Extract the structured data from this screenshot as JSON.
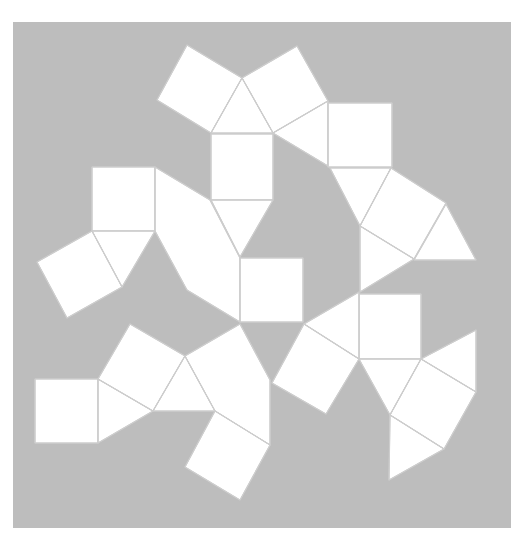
{
  "diagram": {
    "title": "",
    "colors": {
      "page": "#ffffff",
      "background": "#bdbdbd",
      "face_fill": "#ffffff",
      "edge_stroke": "#cdcdcd"
    },
    "background_rect": {
      "x": 13,
      "y": 22,
      "width": 498,
      "height": 506
    },
    "faces": [
      {
        "id": "sq-top-left",
        "type": "square",
        "points": [
          [
            187,
            45
          ],
          [
            242,
            78
          ],
          [
            211,
            133
          ],
          [
            157,
            100
          ]
        ]
      },
      {
        "id": "sq-top-right",
        "type": "square",
        "points": [
          [
            242,
            78
          ],
          [
            297,
            46
          ],
          [
            328,
            101
          ],
          [
            273,
            133
          ]
        ]
      },
      {
        "id": "tri-top-center",
        "type": "triangle",
        "points": [
          [
            242,
            78
          ],
          [
            273,
            133
          ],
          [
            211,
            133
          ]
        ]
      },
      {
        "id": "tri-top-right",
        "type": "triangle",
        "points": [
          [
            273,
            133
          ],
          [
            328,
            101
          ],
          [
            328,
            166
          ]
        ]
      },
      {
        "id": "sq-right-upper",
        "type": "square",
        "points": [
          [
            328,
            103
          ],
          [
            392,
            103
          ],
          [
            392,
            167
          ],
          [
            328,
            167
          ]
        ]
      },
      {
        "id": "sq-center-upper",
        "type": "square",
        "points": [
          [
            211,
            134
          ],
          [
            273,
            134
          ],
          [
            273,
            200
          ],
          [
            211,
            200
          ]
        ]
      },
      {
        "id": "tri-center-upper",
        "type": "triangle",
        "points": [
          [
            211,
            200
          ],
          [
            273,
            200
          ],
          [
            240,
            257
          ]
        ]
      },
      {
        "id": "tri-under-right-sq",
        "type": "triangle",
        "points": [
          [
            330,
            168
          ],
          [
            391,
            168
          ],
          [
            360,
            226
          ]
        ]
      },
      {
        "id": "sq-right-rotated",
        "type": "square",
        "points": [
          [
            391,
            168
          ],
          [
            446,
            203
          ],
          [
            414,
            259
          ],
          [
            360,
            226
          ]
        ]
      },
      {
        "id": "tri-far-right",
        "type": "triangle",
        "points": [
          [
            446,
            204
          ],
          [
            476,
            260
          ],
          [
            414,
            260
          ]
        ]
      },
      {
        "id": "tri-right-lower",
        "type": "triangle",
        "points": [
          [
            360,
            226
          ],
          [
            414,
            259
          ],
          [
            360,
            292
          ]
        ]
      },
      {
        "id": "sq-left-upper",
        "type": "square",
        "points": [
          [
            92,
            167
          ],
          [
            155,
            167
          ],
          [
            155,
            231
          ],
          [
            92,
            231
          ]
        ]
      },
      {
        "id": "tri-left-upper",
        "type": "triangle",
        "points": [
          [
            92,
            231
          ],
          [
            155,
            231
          ],
          [
            122,
            287
          ]
        ]
      },
      {
        "id": "sq-left-rotated",
        "type": "square",
        "points": [
          [
            92,
            231
          ],
          [
            122,
            287
          ],
          [
            67,
            318
          ],
          [
            37,
            262
          ]
        ]
      },
      {
        "id": "merged-center-left",
        "type": "polygon",
        "points": [
          [
            155,
            167
          ],
          [
            210,
            200
          ],
          [
            240,
            258
          ],
          [
            240,
            322
          ],
          [
            187,
            290
          ],
          [
            155,
            231
          ]
        ]
      },
      {
        "id": "sq-center-lower",
        "type": "square",
        "points": [
          [
            240,
            258
          ],
          [
            303,
            258
          ],
          [
            303,
            322
          ],
          [
            240,
            322
          ]
        ]
      },
      {
        "id": "sq-bottom-left",
        "type": "square",
        "points": [
          [
            35,
            379
          ],
          [
            98,
            379
          ],
          [
            98,
            443
          ],
          [
            35,
            443
          ]
        ]
      },
      {
        "id": "tri-bottom-left",
        "type": "triangle",
        "points": [
          [
            98,
            379
          ],
          [
            153,
            411
          ],
          [
            98,
            443
          ]
        ]
      },
      {
        "id": "sq-bottom-left-rotated",
        "type": "square",
        "points": [
          [
            98,
            379
          ],
          [
            130,
            324
          ],
          [
            185,
            356
          ],
          [
            153,
            411
          ]
        ]
      },
      {
        "id": "tri-bottom-center",
        "type": "triangle",
        "points": [
          [
            185,
            356
          ],
          [
            215,
            411
          ],
          [
            153,
            411
          ]
        ]
      },
      {
        "id": "merged-bottom-center",
        "type": "polygon",
        "points": [
          [
            185,
            356
          ],
          [
            240,
            324
          ],
          [
            270,
            380
          ],
          [
            270,
            445
          ],
          [
            215,
            411
          ]
        ]
      },
      {
        "id": "sq-bottom-rotated",
        "type": "square",
        "points": [
          [
            215,
            411
          ],
          [
            270,
            445
          ],
          [
            240,
            500
          ],
          [
            185,
            467
          ]
        ]
      },
      {
        "id": "sq-right-mid",
        "type": "square",
        "points": [
          [
            359,
            294
          ],
          [
            421,
            294
          ],
          [
            421,
            359
          ],
          [
            359,
            359
          ]
        ]
      },
      {
        "id": "tri-right-mid-left",
        "type": "triangle",
        "points": [
          [
            304,
            324
          ],
          [
            359,
            292
          ],
          [
            359,
            359
          ]
        ]
      },
      {
        "id": "sq-right-mid-rotated",
        "type": "square",
        "points": [
          [
            304,
            324
          ],
          [
            359,
            359
          ],
          [
            326,
            414
          ],
          [
            272,
            383
          ]
        ]
      },
      {
        "id": "tri-right-mid-below",
        "type": "triangle",
        "points": [
          [
            359,
            359
          ],
          [
            421,
            359
          ],
          [
            390,
            415
          ]
        ]
      },
      {
        "id": "tri-right-mid-far",
        "type": "triangle",
        "points": [
          [
            421,
            359
          ],
          [
            476,
            330
          ],
          [
            476,
            392
          ]
        ]
      },
      {
        "id": "sq-right-bottom-rotated",
        "type": "square",
        "points": [
          [
            421,
            359
          ],
          [
            476,
            392
          ],
          [
            444,
            449
          ],
          [
            390,
            415
          ]
        ]
      },
      {
        "id": "tri-right-bottom",
        "type": "triangle",
        "points": [
          [
            390,
            415
          ],
          [
            444,
            449
          ],
          [
            389,
            480
          ]
        ]
      }
    ]
  }
}
